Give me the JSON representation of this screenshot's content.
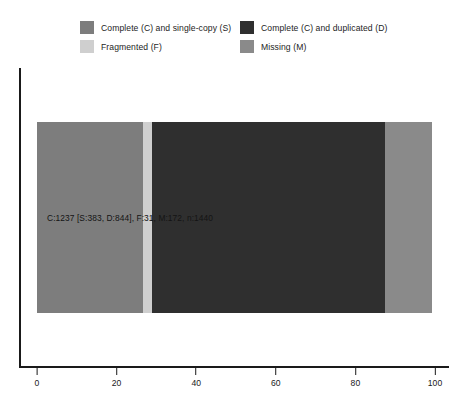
{
  "legend": {
    "items": [
      {
        "label": "Complete (C) and single-copy (S)",
        "color": "#7d7d7d",
        "key": "S",
        "icon": "legend-swatch-icon"
      },
      {
        "label": "Complete (C) and duplicated (D)",
        "color": "#2f2f2f",
        "key": "D",
        "icon": "legend-swatch-icon"
      },
      {
        "label": "Fragmented (F)",
        "color": "#cfcfcf",
        "key": "F",
        "icon": "legend-swatch-icon"
      },
      {
        "label": "Missing (M)",
        "color": "#8a8a8a",
        "key": "M",
        "icon": "legend-swatch-icon"
      }
    ]
  },
  "axis": {
    "ticks": [
      {
        "label": "0",
        "value": 0
      },
      {
        "label": "20",
        "value": 20
      },
      {
        "label": "40",
        "value": 40
      },
      {
        "label": "60",
        "value": 60
      },
      {
        "label": "80",
        "value": 80
      },
      {
        "label": "100",
        "value": 100
      }
    ]
  },
  "bar": {
    "label": "C:1237 [S:383, D:844], F:31, M:172, n:1440"
  },
  "chart_data": {
    "type": "bar",
    "orientation": "horizontal",
    "stacked": true,
    "title": "",
    "subtitle": "",
    "xlabel": "",
    "ylabel": "",
    "xlim": [
      0,
      100
    ],
    "xticks": [
      0,
      20,
      40,
      60,
      80,
      100
    ],
    "grid": false,
    "legend_position": "top",
    "categories": [
      ""
    ],
    "series": [
      {
        "name": "Complete (C) and single-copy (S)",
        "key": "S",
        "color": "#7d7d7d",
        "values": [
          26.6
        ],
        "count": 383
      },
      {
        "name": "Fragmented (F)",
        "key": "F",
        "color": "#cfcfcf",
        "values": [
          2.2
        ],
        "count": 31
      },
      {
        "name": "Complete (C) and duplicated (D)",
        "key": "D",
        "color": "#2f2f2f",
        "values": [
          58.6
        ],
        "count": 844
      },
      {
        "name": "Missing (M)",
        "key": "M",
        "color": "#8a8a8a",
        "values": [
          11.9
        ],
        "count": 172
      }
    ],
    "annotations": [
      {
        "text": "C:1237 [S:383, D:844], F:31, M:172, n:1440",
        "x": 3,
        "y": 0
      }
    ],
    "totals": {
      "complete": 1237,
      "single_copy": 383,
      "duplicated": 844,
      "fragmented": 31,
      "missing": 172,
      "n": 1440
    }
  }
}
